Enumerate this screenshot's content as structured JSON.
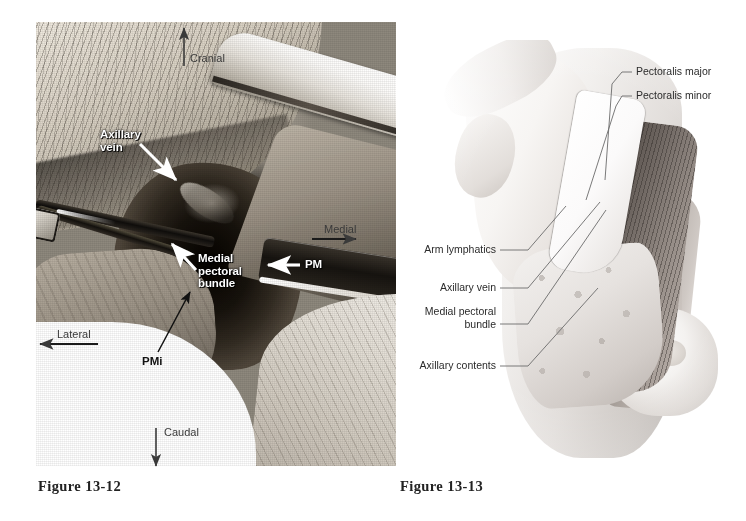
{
  "page": {
    "background_color": "#ffffff",
    "width": 746,
    "height": 521
  },
  "figures": [
    {
      "id": "figure-13-12",
      "kind": "surgical-photograph",
      "caption": "Figure 13-12",
      "description": "Intraoperative photograph of an axillary dissection showing the axillary vein, medial pectoral bundle, pectoralis major and pectoralis minor muscles",
      "annotations": [
        {
          "name": "axillary-vein",
          "text": "Axillary\nvein",
          "style": "white-bold",
          "arrow": "white"
        },
        {
          "name": "medial-pectoral-bundle",
          "text": "Medial\npectoral\nbundle",
          "style": "white-bold",
          "arrow": "white"
        },
        {
          "name": "pectoralis-major-abbrev",
          "text": "PM",
          "style": "white-bold",
          "arrow": "white"
        },
        {
          "name": "pectoralis-minor-abbrev",
          "text": "PMi",
          "style": "black-bold",
          "arrow": "black"
        }
      ],
      "orientation_markers": [
        {
          "name": "cranial",
          "text": "Cranial",
          "direction": "up"
        },
        {
          "name": "medial",
          "text": "Medial",
          "direction": "right"
        },
        {
          "name": "lateral",
          "text": "Lateral",
          "direction": "left"
        },
        {
          "name": "caudal",
          "text": "Caudal",
          "direction": "down"
        }
      ]
    },
    {
      "id": "figure-13-13",
      "kind": "anatomical-illustration",
      "caption": "Figure 13-13",
      "description": "Line-and-wash drawing of the same axillary dissection with the arm abducted, showing labelled structures",
      "labels": [
        {
          "name": "pectoralis-major",
          "text": "Pectoralis major",
          "side": "right"
        },
        {
          "name": "pectoralis-minor",
          "text": "Pectoralis minor",
          "side": "right"
        },
        {
          "name": "arm-lymphatics",
          "text": "Arm lymphatics",
          "side": "left"
        },
        {
          "name": "axillary-vein",
          "text": "Axillary vein",
          "side": "left"
        },
        {
          "name": "medial-pectoral-bundle",
          "text": "Medial pectoral\nbundle",
          "side": "left"
        },
        {
          "name": "axillary-contents",
          "text": "Axillary contents",
          "side": "left"
        }
      ]
    }
  ],
  "colors": {
    "page_background": "#ffffff",
    "caption_text": "#222222",
    "label_text": "#2b2b2b",
    "photo_white_label": "#ffffff",
    "photo_black_label": "#111111",
    "leader_line": "#6b6b6b"
  }
}
